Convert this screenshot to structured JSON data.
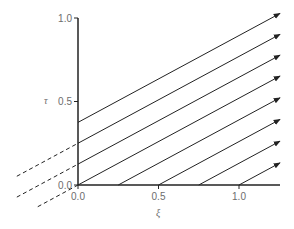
{
  "figure": {
    "type": "characteristics-diagram",
    "xlabel": "ξ",
    "ylabel": "τ",
    "x_ticks": [
      {
        "value": 0.0,
        "label": "0.0"
      },
      {
        "value": 0.5,
        "label": "0.5"
      },
      {
        "value": 1.0,
        "label": "1.0"
      }
    ],
    "y_ticks": [
      {
        "value": 0.0,
        "label": "0.0"
      },
      {
        "value": 0.5,
        "label": "0.5"
      },
      {
        "value": 1.0,
        "label": "1.0"
      }
    ],
    "xlim": [
      0,
      1.25
    ],
    "ylim": [
      0,
      1.0
    ],
    "colors": {
      "line": "#222222",
      "axis": "#222222",
      "text": "#6d6d6d"
    },
    "characteristic_slope": 0.52,
    "solid_lines_from_tau_axis": [
      {
        "tau0": 0.375
      },
      {
        "tau0": 0.25
      },
      {
        "tau0": 0.125
      },
      {
        "tau0": 0.0
      }
    ],
    "solid_lines_from_xi_axis": [
      {
        "xi0": 0.25
      },
      {
        "xi0": 0.5
      },
      {
        "xi0": 0.75
      },
      {
        "xi0": 1.0
      }
    ],
    "dashed_extensions": [
      {
        "tau0": 0.25,
        "xi_start": -0.38
      },
      {
        "tau0": 0.125,
        "xi_start": -0.38
      },
      {
        "tau0": 0.0,
        "xi_start": -0.25
      }
    ],
    "arrowheads": true
  }
}
